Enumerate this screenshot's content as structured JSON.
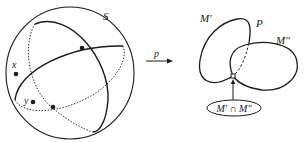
{
  "diagram": {
    "sphere_label": "S",
    "point_x_label": "x",
    "point_y_label": "y",
    "map_label": "p",
    "space_label": "P",
    "set_m1_label": "M′",
    "set_m2_label": "M″",
    "intersection_label": "M′ ∩ M″"
  },
  "colors": {
    "stroke": "#1a1a1a",
    "background": "#ffffff"
  }
}
